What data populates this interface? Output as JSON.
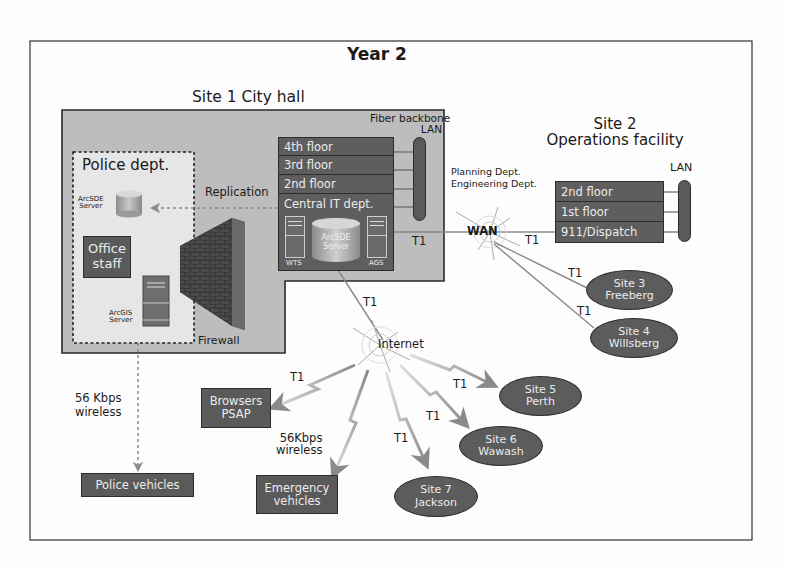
{
  "title": "Year 2",
  "site1": {
    "title": "Site 1 City hall",
    "backbone_label_line1": "Fiber backbone",
    "backbone_label_line2": "LAN",
    "floors": [
      "4th floor",
      "3rd floor",
      "2nd floor",
      "Central IT dept."
    ],
    "central_it": {
      "wts_label": "WTS",
      "ags_label": "AGS",
      "arcsde_line1": "ArcSDE",
      "arcsde_line2": "Server"
    },
    "replication_label": "Replication",
    "firewall_label": "Firewall",
    "police": {
      "title": "Police dept.",
      "arcsde_line1": "ArcSDE",
      "arcsde_line2": "Server",
      "office_line1": "Office",
      "office_line2": "staff",
      "arcgis_line1": "ArcGIS",
      "arcgis_line2": "Server"
    }
  },
  "site2": {
    "title_line1": "Site 2",
    "title_line2": "Operations facility",
    "lan_label": "LAN",
    "depts_line1": "Planning Dept.",
    "depts_line2": "Engineering Dept.",
    "floors": [
      "2nd floor",
      "1st floor",
      "911/Dispatch"
    ]
  },
  "network": {
    "wan_label": "WAN",
    "internet_label": "Internet",
    "t1": "T1"
  },
  "sites": [
    {
      "line1": "Site 3",
      "line2": "Freeberg"
    },
    {
      "line1": "Site 4",
      "line2": "Willsberg"
    },
    {
      "line1": "Site 5",
      "line2": "Perth"
    },
    {
      "line1": "Site 6",
      "line2": "Wawash"
    },
    {
      "line1": "Site 7",
      "line2": "Jackson"
    }
  ],
  "endpoints": {
    "browsers_line1": "Browsers",
    "browsers_line2": "PSAP",
    "emergency_line1": "Emergency",
    "emergency_line2": "vehicles",
    "police_vehicles": "Police vehicles",
    "wireless_left_line1": "56 Kbps",
    "wireless_left_line2": "wireless",
    "wireless_right_line1": "56Kbps",
    "wireless_right_line2": "wireless"
  },
  "colors": {
    "box_fill": "#5a5a5a",
    "cityhall_fill": "#bdbdbd",
    "police_fill": "#e6e6e6",
    "line": "#8a8a8a"
  }
}
